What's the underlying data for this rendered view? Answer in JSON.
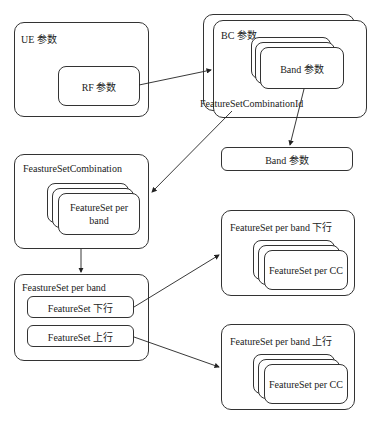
{
  "diagram": {
    "ue": {
      "title": "UE 参数",
      "rf": "RF 参数"
    },
    "bc": {
      "title": "BC 参数",
      "band": "Band 参数",
      "fsc_id": "FeatureSetCombinationId"
    },
    "band_params": "Band 参数",
    "fsc": {
      "title": "FeastureSetCombination",
      "item": "FeatureSet per band"
    },
    "fspb": {
      "title": "FeastureSet per band",
      "dl": "FeatureSet 下行",
      "ul": "FeatureSet 上行"
    },
    "dl_box": {
      "title": "FeatureSet per band 下行",
      "item": "FeatureSet per CC"
    },
    "ul_box": {
      "title": "FeatureSet per band 上行",
      "item": "FeatureSet per CC"
    }
  }
}
